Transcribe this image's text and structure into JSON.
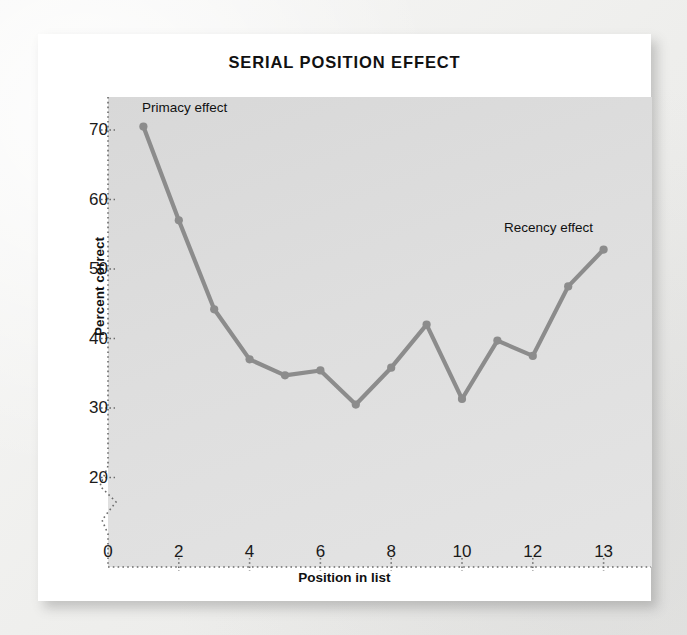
{
  "figure": {
    "title": "SERIAL POSITION EFFECT"
  },
  "chart_data": {
    "type": "line",
    "title": "SERIAL POSITION EFFECT",
    "xlabel": "Position in list",
    "ylabel": "Percent correct",
    "x": [
      1,
      2,
      3,
      4,
      5,
      6,
      7,
      8,
      9,
      10,
      11,
      12,
      13,
      14
    ],
    "values": [
      70.5,
      57.0,
      44.2,
      37.0,
      34.7,
      35.4,
      30.5,
      35.8,
      42.0,
      31.3,
      39.7,
      37.5,
      47.5,
      52.8
    ],
    "series": [
      {
        "name": "Percent correct",
        "values": [
          70.5,
          57.0,
          44.2,
          37.0,
          34.7,
          35.4,
          30.5,
          35.8,
          42.0,
          31.3,
          39.7,
          37.5,
          47.5,
          52.8
        ]
      }
    ],
    "xticks": [
      0,
      2,
      4,
      6,
      8,
      10,
      12,
      13
    ],
    "xtick_labels": [
      "0",
      "2",
      "4",
      "6",
      "8",
      "10",
      "12",
      "13"
    ],
    "yticks": [
      20,
      30,
      40,
      50,
      60,
      70
    ],
    "ytick_labels": [
      "20",
      "30",
      "40",
      "50",
      "60",
      "70"
    ],
    "xlim": [
      0,
      15.3
    ],
    "ylim": [
      12,
      76
    ],
    "grid": false,
    "legend": false,
    "y_axis_break": true,
    "line_color": "#8c8c8c",
    "marker_color": "#8c8c8c",
    "plot_bg": "#dedede",
    "annotations": [
      {
        "text": "Primacy effect",
        "x": 1.0,
        "y": 73.5
      },
      {
        "text": "Recency effect",
        "x": 11.2,
        "y": 56.0
      }
    ]
  },
  "axes": {
    "y_title": "Percent correct",
    "x_title": "Position in list"
  },
  "annotations": {
    "primacy": "Primacy effect",
    "recency": "Recency effect"
  }
}
